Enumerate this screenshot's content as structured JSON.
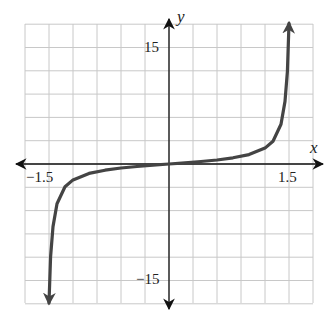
{
  "chart_data": {
    "type": "line",
    "title": "",
    "xlabel": "x",
    "ylabel": "y",
    "xlim": [
      -1.5,
      1.5
    ],
    "ylim": [
      -15,
      15
    ],
    "x_tick_labels": [
      "-1.5",
      "1.5"
    ],
    "y_tick_labels": [
      "15",
      "-15"
    ],
    "grid": true,
    "grid_step": {
      "x": 0.3,
      "y": 3
    },
    "series": [
      {
        "name": "curve",
        "color": "#444444",
        "arrows_at_ends": true,
        "x": [
          -1.5,
          -1.48,
          -1.45,
          -1.4,
          -1.3,
          -1.2,
          -1.0,
          -0.8,
          -0.6,
          -0.4,
          -0.2,
          0,
          0.2,
          0.4,
          0.6,
          0.8,
          1.0,
          1.2,
          1.3,
          1.4,
          1.45,
          1.48,
          1.5
        ],
        "y": [
          -18.1,
          -11.9,
          -8.06,
          -5.12,
          -2.94,
          -2.05,
          -1.21,
          -0.8,
          -0.52,
          -0.32,
          -0.15,
          0,
          0.15,
          0.32,
          0.52,
          0.8,
          1.21,
          2.05,
          2.94,
          5.12,
          8.06,
          11.9,
          18.1
        ]
      }
    ]
  },
  "labels": {
    "x_axis": "x",
    "y_axis": "y",
    "x_min": "−1.5",
    "x_max": "1.5",
    "y_max": "15",
    "y_min": "−15"
  }
}
